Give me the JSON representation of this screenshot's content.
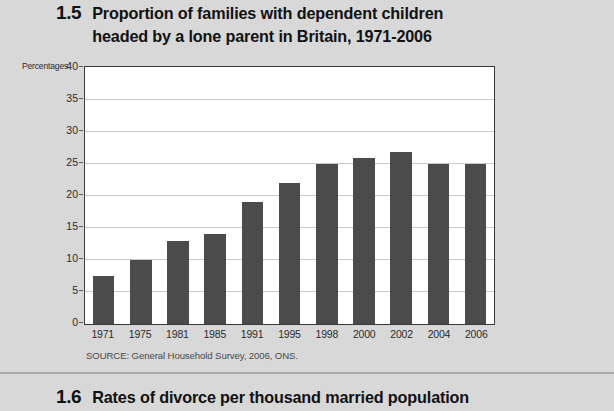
{
  "figure": {
    "number": "1.5",
    "title_line1": "Proportion of families with dependent children",
    "title_line2": "headed by a lone parent in Britain, 1971-2006",
    "axis_unit_label": "Percentages",
    "source": "SOURCE: General Household Survey, 2006, ONS."
  },
  "next_figure": {
    "number": "1.6",
    "title": "Rates of divorce per thousand married population"
  },
  "colors": {
    "page_background": "#d8d8d8",
    "plot_background": "#ffffff",
    "bar_fill": "#4b4b4b",
    "gridline": "#c9c9c9",
    "frame": "#3a3a3a",
    "text": "#1a1a1a"
  },
  "chart_data": {
    "type": "bar",
    "title": "Proportion of families with dependent children headed by a lone parent in Britain, 1971-2006",
    "xlabel": "",
    "ylabel": "Percentages",
    "ylim": [
      0,
      40
    ],
    "yticks": [
      0,
      5,
      10,
      15,
      20,
      25,
      30,
      35,
      40
    ],
    "ytick_labels": [
      "0",
      "5",
      "10",
      "15",
      "20",
      "25",
      "30",
      "35",
      "40"
    ],
    "grid": true,
    "legend": false,
    "categories": [
      "1971",
      "1975",
      "1981",
      "1985",
      "1991",
      "1995",
      "1998",
      "2000",
      "2002",
      "2004",
      "2006"
    ],
    "values": [
      7.5,
      10,
      13,
      14,
      19,
      22,
      25,
      26,
      26.8,
      25,
      25
    ],
    "source": "SOURCE: General Household Survey, 2006, ONS."
  }
}
